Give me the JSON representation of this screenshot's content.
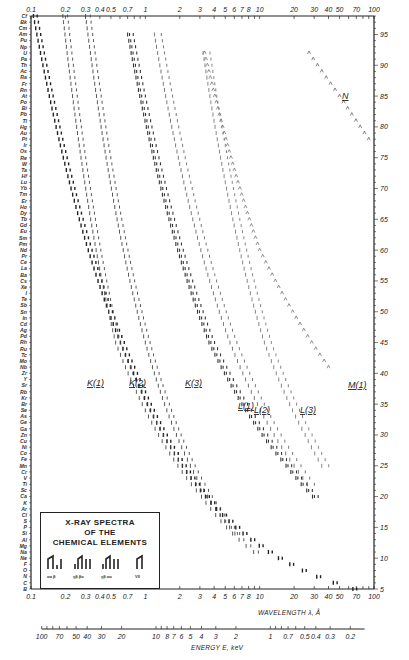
{
  "chart_data": {
    "type": "scatter",
    "title": "X-RAY SPECTRA OF THE CHEMICAL ELEMENTS",
    "xlabel": "WAVELENGTH λ, Å",
    "x2label": "ENERGY E, keV",
    "ylabel": "Atomic number Z",
    "xscale": "log",
    "xlim": [
      0.1,
      100
    ],
    "ylim": [
      5,
      98
    ],
    "x_ticks_top": [
      "0.1",
      "0.2",
      "0.3",
      "0.4",
      "0.5",
      "0.7",
      "1",
      "2",
      "3",
      "4",
      "5",
      "6",
      "7",
      "8",
      "10",
      "20",
      "30",
      "40",
      "50",
      "70",
      "100"
    ],
    "x_ticks_bottom": [
      "0.1",
      "0.2",
      "0.3",
      "0.4",
      "0.5",
      "0.7",
      "1",
      "2",
      "3",
      "4",
      "5",
      "6",
      "7",
      "8",
      "10",
      "20",
      "30",
      "40",
      "50",
      "70",
      "100"
    ],
    "energy_ticks": [
      "100",
      "70",
      "50",
      "40",
      "30",
      "20",
      "10",
      "8",
      "7",
      "6",
      "5",
      "4",
      "3",
      "2",
      "1",
      "0.7",
      "0.5",
      "0.4",
      "0.3",
      "0.2"
    ],
    "y_ticks_right": [
      "5",
      "10",
      "15",
      "20",
      "25",
      "30",
      "35",
      "40",
      "45",
      "50",
      "55",
      "60",
      "65",
      "70",
      "75",
      "80",
      "85",
      "90",
      "95"
    ],
    "element_labels": [
      "Cf",
      "Bk",
      "Cm",
      "Am",
      "Pu",
      "Np",
      "U",
      "Pa",
      "Th",
      "Ac",
      "Ra",
      "Fr",
      "Rn",
      "At",
      "Po",
      "Bi",
      "Pb",
      "Tl",
      "Hg",
      "Au",
      "Pt",
      "Ir",
      "Os",
      "Re",
      "W",
      "Ta",
      "Hf",
      "Lu",
      "Yb",
      "Tm",
      "Er",
      "Ho",
      "Dy",
      "Tb",
      "Gd",
      "Eu",
      "Sm",
      "Pm",
      "Nd",
      "Pr",
      "Ce",
      "La",
      "Ba",
      "Cs",
      "Xe",
      "I",
      "Te",
      "Sb",
      "Sn",
      "In",
      "Cd",
      "Ag",
      "Pd",
      "Rh",
      "Ru",
      "Tc",
      "Mo",
      "Nb",
      "Zr",
      "Y",
      "Sr",
      "Rb",
      "Kr",
      "Br",
      "Se",
      "As",
      "Ge",
      "Ga",
      "Zn",
      "Cu",
      "Ni",
      "Co",
      "Fe",
      "Mn",
      "Cr",
      "V",
      "Ti",
      "Sc",
      "Ca",
      "K",
      "Ar",
      "Cl",
      "S",
      "P",
      "Si",
      "Al",
      "Mg",
      "Na",
      "Ne",
      "F",
      "O",
      "N",
      "C",
      "B"
    ],
    "series": [
      {
        "name": "K(1)",
        "z_range": [
          5,
          98
        ],
        "lambda_at_z": {
          "98": 0.105,
          "40": 0.79,
          "20": 3.36,
          "10": 14.6
        }
      },
      {
        "name": "K(2)",
        "z_range": [
          11,
          98
        ],
        "lambda_at_z": {
          "98": 0.19,
          "45": 0.55,
          "20": 3.1
        }
      },
      {
        "name": "K(3)",
        "z_range": [
          14,
          98
        ],
        "lambda_at_z": {
          "98": 0.3,
          "45": 1.0,
          "20": 3.5
        }
      },
      {
        "name": "L(1)",
        "z_range": [
          20,
          95
        ],
        "lambda_at_z": {
          "95": 0.7,
          "45": 3.6,
          "25": 17
        }
      },
      {
        "name": "L(2)",
        "z_range": [
          22,
          95
        ],
        "lambda_at_z": {
          "95": 1.2,
          "45": 5.5,
          "25": 20
        }
      },
      {
        "name": "L(3)",
        "z_range": [
          25,
          92
        ],
        "lambda_at_z": {
          "92": 3.2,
          "45": 11,
          "30": 25
        }
      },
      {
        "name": "M(1)",
        "z_range": [
          41,
          92
        ],
        "lambda_at_z": {
          "92": 3.3,
          "60": 10,
          "41": 40
        }
      },
      {
        "name": "N",
        "z_range": [
          78,
          92
        ],
        "lambda_at_z": {
          "92": 27,
          "85": 50,
          "78": 90
        }
      }
    ],
    "legend": {
      "title_lines": [
        "X-RAY SPECTRA",
        "OF THE",
        "CHEMICAL ELEMENTS"
      ],
      "groups": [
        {
          "symbol": "K",
          "lines": [
            "α1",
            "α2",
            "β1"
          ]
        },
        {
          "symbol": "L",
          "lines": [
            "γ1",
            "β2",
            "β1",
            "α1"
          ]
        },
        {
          "symbol": "M",
          "lines": [
            "γ",
            "β",
            "α1",
            "α2"
          ]
        },
        {
          "symbol": "N",
          "lines": [
            "VII",
            "ab"
          ]
        }
      ]
    },
    "grid": false
  },
  "labels": {
    "xlabel": "WAVELENGTH λ, Å",
    "x2label": "ENERGY E, keV",
    "series": [
      "K(1)",
      "K(2)",
      "K(3)",
      "L(1)",
      "L(2)",
      "L(3)",
      "M(1)",
      "N"
    ],
    "legend_title": [
      "X-RAY SPECTRA",
      "OF THE",
      "CHEMICAL ELEMENTS"
    ]
  }
}
